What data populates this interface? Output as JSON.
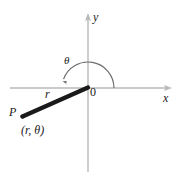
{
  "figure": {
    "type": "polar-coordinate-diagram",
    "background_color": "#ffffff",
    "axis_color": "#b9b9b9",
    "ray_color": "#1a1a1a",
    "arc_color": "#6e6e6e",
    "label_color": "#1a1a1a",
    "labels": {
      "y_axis": "y",
      "x_axis": "x",
      "angle": "θ",
      "radius": "r",
      "origin": "0",
      "point": "P",
      "coordinates": "(r, θ)"
    },
    "geometry": {
      "origin": [
        88,
        88
      ],
      "x_axis_span": [
        10,
        172
      ],
      "y_axis_span": [
        13,
        172
      ],
      "point_p": [
        22,
        117
      ],
      "ray_thickness_px": 4,
      "arc_radius_px": 26,
      "arc_start_deg": 0,
      "arc_end_deg": 160,
      "ray_angle_deg": 160
    }
  }
}
